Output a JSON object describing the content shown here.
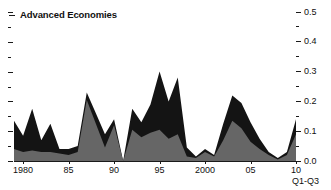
{
  "header": {
    "title": "Advanced Economies",
    "marker_icon": "dash-marker-icon"
  },
  "axis_note": "Q1-Q3",
  "chart_data": {
    "type": "area",
    "title": "Advanced Economies",
    "xlabel": "",
    "ylabel": "",
    "xlim": [
      1979,
      2010
    ],
    "ylim": [
      0.0,
      0.5
    ],
    "grid": false,
    "legend_position": "none",
    "annotations": [
      "Q1-Q3"
    ],
    "axis_side": "right",
    "y_major_ticks": [
      0.0,
      0.1,
      0.2,
      0.3,
      0.4,
      0.5
    ],
    "y_tick_labels": [
      "0.0",
      "0.1",
      "0.2",
      "0.3",
      "0.4",
      "0.5"
    ],
    "y_minor_ticks": [
      0.05,
      0.15,
      0.25,
      0.35,
      0.45
    ],
    "x_major_ticks": [
      1980,
      1985,
      1990,
      1995,
      2000,
      2005,
      2010
    ],
    "x_tick_labels": [
      "1980",
      "85",
      "90",
      "95",
      "2000",
      "05",
      "10"
    ],
    "x": [
      1979,
      1980,
      1981,
      1982,
      1983,
      1984,
      1985,
      1986,
      1987,
      1988,
      1989,
      1990,
      1991,
      1992,
      1993,
      1994,
      1995,
      1996,
      1997,
      1998,
      1999,
      2000,
      2001,
      2002,
      2003,
      2004,
      2005,
      2006,
      2007,
      2008,
      2009,
      2010
    ],
    "series": [
      {
        "name": "Total",
        "color": "#141414",
        "values": [
          0.135,
          0.085,
          0.175,
          0.07,
          0.125,
          0.04,
          0.04,
          0.05,
          0.23,
          0.16,
          0.09,
          0.14,
          0.0,
          0.175,
          0.13,
          0.19,
          0.3,
          0.2,
          0.28,
          0.045,
          0.015,
          0.04,
          0.02,
          0.125,
          0.22,
          0.195,
          0.13,
          0.075,
          0.03,
          0.01,
          0.03,
          0.14
        ]
      },
      {
        "name": "Subcomponent",
        "color": "#666666",
        "values": [
          0.04,
          0.03,
          0.035,
          0.03,
          0.03,
          0.025,
          0.02,
          0.03,
          0.205,
          0.125,
          0.045,
          0.12,
          0.0,
          0.105,
          0.08,
          0.095,
          0.105,
          0.075,
          0.09,
          0.015,
          0.01,
          0.03,
          0.015,
          0.07,
          0.135,
          0.11,
          0.065,
          0.04,
          0.02,
          0.005,
          0.02,
          0.09
        ]
      }
    ]
  }
}
